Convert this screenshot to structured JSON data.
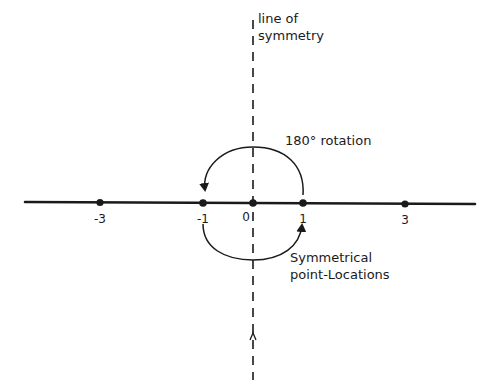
{
  "labels": {
    "symmetry_line_1": "line of",
    "symmetry_line_2": "symmetry",
    "rotation": "180° rotation",
    "points_line_1": "Symmetrical",
    "points_line_2": "point-Locations"
  },
  "axis": {
    "ticks": [
      {
        "label": "-3",
        "x": 100
      },
      {
        "label": "-1",
        "x": 203
      },
      {
        "label": "0",
        "x": 253
      },
      {
        "label": "1",
        "x": 303
      },
      {
        "label": "3",
        "x": 405
      }
    ]
  },
  "colors": {
    "ink": "#1a1a1a",
    "background": "#ffffff"
  }
}
